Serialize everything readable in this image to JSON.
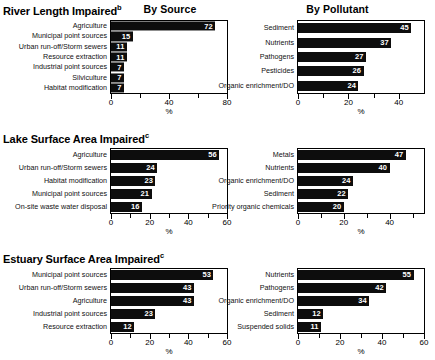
{
  "headers": {
    "by_source": "By Source",
    "by_pollutant": "By Pollutant"
  },
  "axis_caption": "%",
  "sections": [
    {
      "title": "River Length Impaired",
      "note": "b"
    },
    {
      "title": "Lake Surface Area Impaired",
      "note": "c"
    },
    {
      "title": "Estuary Surface Area Impaired",
      "note": "c"
    }
  ],
  "chart_data": [
    {
      "type": "bar",
      "title": "River Length Impaired - By Source",
      "orientation": "horizontal",
      "categories": [
        "Agriculture",
        "Municipal point sources",
        "Urban run-off/Storm sewers",
        "Resource extraction",
        "Industrial point sources",
        "Silviculture",
        "Habitat modification"
      ],
      "values": [
        72,
        15,
        11,
        11,
        7,
        7,
        7
      ],
      "xlabel": "%",
      "ylabel": "",
      "xlim": [
        0,
        80
      ],
      "xticks": [
        0,
        20,
        40,
        60,
        80
      ],
      "xticklabels": [
        "0",
        "",
        "40",
        "",
        "80"
      ],
      "grid": false,
      "legend": false
    },
    {
      "type": "bar",
      "title": "River Length Impaired - By Pollutant",
      "orientation": "horizontal",
      "categories": [
        "Sediment",
        "Nutrients",
        "Pathogens",
        "Pesticides",
        "Organic enrichment/DO"
      ],
      "values": [
        45,
        37,
        27,
        26,
        24
      ],
      "xlabel": "%",
      "ylabel": "",
      "xlim": [
        0,
        50
      ],
      "xticks": [
        0,
        10,
        20,
        30,
        40
      ],
      "xticklabels": [
        "0",
        "",
        "20",
        "",
        "40"
      ],
      "grid": false,
      "legend": false
    },
    {
      "type": "bar",
      "title": "Lake Surface Area Impaired - By Source",
      "orientation": "horizontal",
      "categories": [
        "Agriculture",
        "Urban run-off/Storm sewers",
        "Habitat modification",
        "Municipal point sources",
        "On-site waste water disposal"
      ],
      "values": [
        56,
        24,
        23,
        21,
        16
      ],
      "xlabel": "%",
      "ylabel": "",
      "xlim": [
        0,
        60
      ],
      "xticks": [
        0,
        10,
        20,
        30,
        40,
        50,
        60
      ],
      "xticklabels": [
        "0",
        "",
        "20",
        "",
        "40",
        "",
        "60"
      ],
      "grid": false,
      "legend": false
    },
    {
      "type": "bar",
      "title": "Lake Surface Area Impaired - By Pollutant",
      "orientation": "horizontal",
      "categories": [
        "Metals",
        "Nutrients",
        "Organic enrichment/DO",
        "Sediment",
        "Priority organic chemicals"
      ],
      "values": [
        47,
        40,
        24,
        22,
        20
      ],
      "xlabel": "%",
      "ylabel": "",
      "xlim": [
        0,
        55
      ],
      "xticks": [
        0,
        10,
        20,
        30,
        40,
        50
      ],
      "xticklabels": [
        "0",
        "",
        "20",
        "",
        "40",
        ""
      ],
      "grid": false,
      "legend": false
    },
    {
      "type": "bar",
      "title": "Estuary Surface Area Impaired - By Source",
      "orientation": "horizontal",
      "categories": [
        "Municipal point sources",
        "Urban run-off/Storm sewers",
        "Agriculture",
        "Industrial point sources",
        "Resource extraction"
      ],
      "values": [
        53,
        43,
        43,
        23,
        12
      ],
      "xlabel": "%",
      "ylabel": "",
      "xlim": [
        0,
        60
      ],
      "xticks": [
        0,
        10,
        20,
        30,
        40,
        50,
        60
      ],
      "xticklabels": [
        "0",
        "",
        "20",
        "",
        "40",
        "",
        "60"
      ],
      "grid": false,
      "legend": false
    },
    {
      "type": "bar",
      "title": "Estuary Surface Area Impaired - By Pollutant",
      "orientation": "horizontal",
      "categories": [
        "Nutrients",
        "Pathogens",
        "Organic enrichment/DO",
        "Sediment",
        "Suspended solids"
      ],
      "values": [
        55,
        42,
        34,
        12,
        11
      ],
      "xlabel": "%",
      "ylabel": "",
      "xlim": [
        0,
        60
      ],
      "xticks": [
        0,
        10,
        20,
        30,
        40,
        50,
        60
      ],
      "xticklabels": [
        "0",
        "",
        "20",
        "",
        "40",
        "",
        "60"
      ],
      "grid": false,
      "legend": false
    }
  ]
}
